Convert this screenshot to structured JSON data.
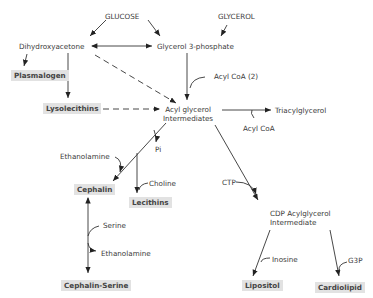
{
  "diagram": {
    "nodes": {
      "glucose": "GLUCOSE",
      "glycerol": "GLYCEROL",
      "dihydroxyacetone": "Dihydroxyacetone",
      "glycerol_3_phosphate": "Glycerol 3-phosphate",
      "plasmalogen": "Plasmalogen",
      "lysolecithins": "Lysolecithins",
      "acyl_glycerol_1": "Acyl glycerol",
      "acyl_glycerol_2": "Intermediates",
      "triacylglycerol": "Triacylglycerol",
      "cephalin": "Cephalin",
      "lecithins": "Lecithins",
      "cephalin_serine": "Cephalin-Serine",
      "cdp_1": "CDP Acylglycerol",
      "cdp_2": "Intermediate",
      "lipositol": "Lipositol",
      "cardiolipid": "Cardiolipid"
    },
    "cofactors": {
      "acyl_coa_2": "Acyl CoA (2)",
      "acyl_coa": "Acyl CoA",
      "ethanolamine_1": "Ethanolamine",
      "pi": "Pi",
      "choline": "Choline",
      "ctp": "CTP",
      "serine": "Serine",
      "ethanolamine_2": "Ethanolamine",
      "inosine": "Inosine",
      "g3p": "G3P"
    },
    "highlight_color": "#e2e2e2"
  }
}
